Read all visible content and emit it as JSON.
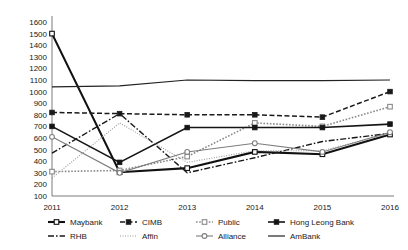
{
  "chart_data": {
    "type": "line",
    "title": "",
    "subtitle": "",
    "xlabel": "",
    "ylabel": "",
    "categories": [
      "2011",
      "2012",
      "2013",
      "2014",
      "2015",
      "2016"
    ],
    "x": [
      2011,
      2012,
      2013,
      2014,
      2015,
      2016
    ],
    "ylim": [
      100,
      1600
    ],
    "ytick_step": 100,
    "yticks": [
      100,
      200,
      300,
      400,
      500,
      600,
      700,
      800,
      900,
      1000,
      1100,
      1200,
      1300,
      1400,
      1500,
      1600
    ],
    "ytick_labels": [
      "100",
      "200",
      "300",
      "400",
      "500",
      "600",
      "700",
      "800",
      "900",
      "1000",
      "1100",
      "1200",
      "1300",
      "1400",
      "1500",
      "1600"
    ],
    "xtick_labels": [
      "2011",
      "2012",
      "2013",
      "2014",
      "2015",
      "2016"
    ],
    "grid": false,
    "legend_position": "bottom",
    "legend_columns": 3,
    "series": [
      {
        "name": "Maybank",
        "values": [
          1500,
          305,
          340,
          480,
          460,
          630
        ],
        "color": "#111111",
        "line_style": "solid",
        "line_width": 2.1,
        "marker": "open-square",
        "legend_marker": "open-square-line"
      },
      {
        "name": "CIMB",
        "values": [
          820,
          810,
          800,
          800,
          780,
          1000
        ],
        "color": "#1a1a1a",
        "line_style": "dashed",
        "line_width": 1.5,
        "marker": "filled-square",
        "legend_marker": "filled-square-dash"
      },
      {
        "name": "Public",
        "values": [
          310,
          320,
          440,
          730,
          700,
          870
        ],
        "color": "#8a8a8a",
        "line_style": "dotted",
        "line_width": 1.6,
        "marker": "open-square",
        "legend_marker": "open-square-dot"
      },
      {
        "name": "Hong Leong Bank",
        "values": [
          700,
          390,
          690,
          690,
          690,
          720
        ],
        "color": "#151515",
        "line_style": "solid",
        "line_width": 1.6,
        "marker": "filled-square",
        "legend_marker": "filled-square-line"
      },
      {
        "name": "RHB",
        "values": [
          470,
          810,
          300,
          430,
          570,
          640
        ],
        "color": "#181818",
        "line_style": "dash-dot",
        "line_width": 1.4,
        "marker": "none",
        "legend_marker": "dash-dot"
      },
      {
        "name": "Affin",
        "values": [
          255,
          730,
          390,
          490,
          490,
          640
        ],
        "color": "#9a9a9a",
        "line_style": "fine-dotted",
        "line_width": 1.1,
        "marker": "none",
        "legend_marker": "fine-dotted"
      },
      {
        "name": "Alliance",
        "values": [
          610,
          300,
          480,
          555,
          480,
          650
        ],
        "color": "#7d7d7d",
        "line_style": "solid",
        "line_width": 1.1,
        "marker": "open-circle",
        "legend_marker": "open-circle-line"
      },
      {
        "name": "AmBank",
        "values": [
          1040,
          1050,
          1100,
          1095,
          1095,
          1100
        ],
        "color": "#222222",
        "line_style": "solid",
        "line_width": 1.2,
        "marker": "none",
        "legend_marker": "plain-line"
      }
    ],
    "legend_entries": [
      "Maybank",
      "CIMB",
      "Public",
      "Hong Leong Bank",
      "RHB",
      "Affin",
      "Alliance",
      "AmBank"
    ],
    "annotations": []
  }
}
